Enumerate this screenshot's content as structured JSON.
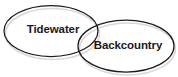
{
  "diagram": {
    "type": "venn-two-set",
    "background_color": "#ffffff",
    "stroke_color": "#1c1c1c",
    "shadow_color": "#b8b8b8",
    "label_color": "#1a1a1a",
    "sets": [
      {
        "id": "tidewater",
        "label": "Tidewater",
        "cx": 51,
        "cy": 31,
        "rx": 47,
        "ry": 25.5,
        "label_x": 53,
        "label_y": 30
      },
      {
        "id": "backcountry",
        "label": "Backcountry",
        "cx": 126,
        "cy": 46,
        "rx": 48,
        "ry": 26,
        "label_x": 128,
        "label_y": 46
      }
    ]
  }
}
